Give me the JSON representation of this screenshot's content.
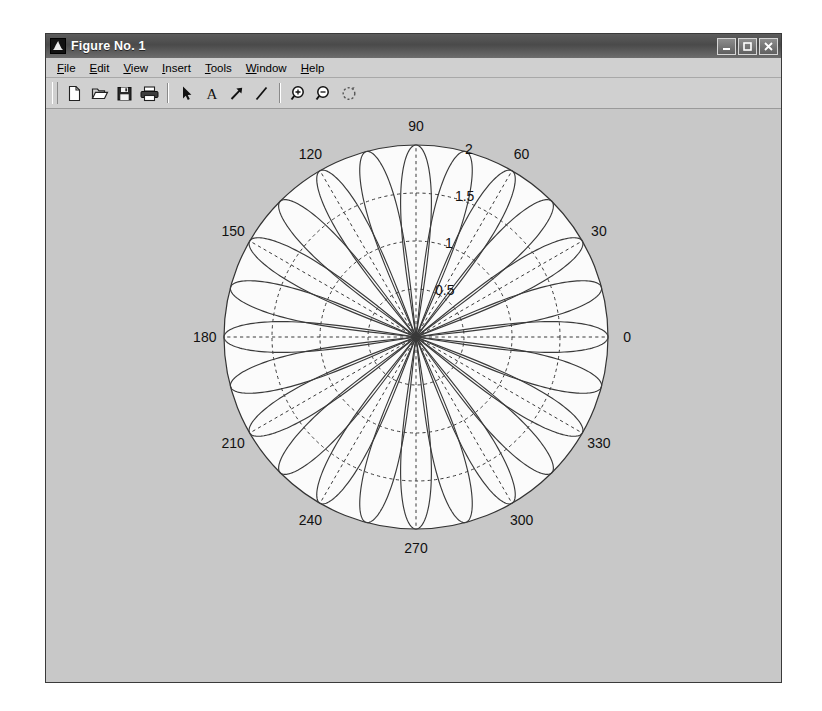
{
  "window": {
    "title": "Figure No. 1",
    "icon": "matlab-membrane-icon",
    "buttons": {
      "minimize": "minimize-icon",
      "maximize": "maximize-icon",
      "close": "close-icon"
    }
  },
  "menubar": {
    "items": [
      {
        "label": "File",
        "mnemonic": "F"
      },
      {
        "label": "Edit",
        "mnemonic": "E"
      },
      {
        "label": "View",
        "mnemonic": "V"
      },
      {
        "label": "Insert",
        "mnemonic": "I"
      },
      {
        "label": "Tools",
        "mnemonic": "T"
      },
      {
        "label": "Window",
        "mnemonic": "W"
      },
      {
        "label": "Help",
        "mnemonic": "H"
      }
    ]
  },
  "toolbar": {
    "groups": [
      [
        "new-figure-icon",
        "open-file-icon",
        "save-figure-icon",
        "print-figure-icon"
      ],
      [
        "pointer-arrow-icon",
        "insert-text-icon",
        "insert-arrow-icon",
        "insert-line-icon"
      ],
      [
        "zoom-in-icon",
        "zoom-out-icon",
        "rotate-3d-icon"
      ]
    ],
    "tooltips": {
      "new-figure-icon": "New Figure",
      "open-file-icon": "Open File",
      "save-figure-icon": "Save Figure",
      "print-figure-icon": "Print Figure",
      "pointer-arrow-icon": "Edit Plot",
      "insert-text-icon": "Insert Text",
      "insert-arrow-icon": "Insert Arrow",
      "insert-line-icon": "Insert Line",
      "zoom-in-icon": "Zoom In",
      "zoom-out-icon": "Zoom Out",
      "rotate-3d-icon": "Rotate 3D"
    }
  },
  "colors": {
    "figure_background": "#c8c8c8",
    "axes_background": "#fbfbfb",
    "line_color": "#3a3a3a",
    "grid_color": "#3a3a3a",
    "title_bar": "#4a4a4a"
  },
  "chart_data": {
    "type": "line",
    "projection": "polar",
    "title": "",
    "xlabel": "",
    "ylabel": "",
    "angle_unit": "degrees",
    "theta_ticks": [
      0,
      30,
      60,
      90,
      120,
      150,
      180,
      210,
      240,
      270,
      300,
      330
    ],
    "theta_tick_labels": [
      "0",
      "30",
      "60",
      "90",
      "120",
      "150",
      "180",
      "210",
      "240",
      "270",
      "300",
      "330"
    ],
    "r_ticks": [
      0.5,
      1,
      1.5,
      2
    ],
    "r_tick_labels": [
      "0.5",
      "1",
      "1.5",
      "2"
    ],
    "rlim": [
      0,
      2
    ],
    "r_label_angle": 78,
    "grid": true,
    "grid_style": "dashed",
    "legend": null,
    "series": [
      {
        "name": "petal-000",
        "lobe_center_deg": 0,
        "peak_r": 2,
        "half_width_deg": 9
      },
      {
        "name": "petal-015",
        "lobe_center_deg": 15,
        "peak_r": 2,
        "half_width_deg": 9
      },
      {
        "name": "petal-030",
        "lobe_center_deg": 30,
        "peak_r": 2,
        "half_width_deg": 9
      },
      {
        "name": "petal-045",
        "lobe_center_deg": 45,
        "peak_r": 2,
        "half_width_deg": 9
      },
      {
        "name": "petal-060",
        "lobe_center_deg": 60,
        "peak_r": 2,
        "half_width_deg": 9
      },
      {
        "name": "petal-075",
        "lobe_center_deg": 75,
        "peak_r": 2,
        "half_width_deg": 9
      },
      {
        "name": "petal-090",
        "lobe_center_deg": 90,
        "peak_r": 2,
        "half_width_deg": 9
      },
      {
        "name": "petal-105",
        "lobe_center_deg": 105,
        "peak_r": 2,
        "half_width_deg": 9
      },
      {
        "name": "petal-120",
        "lobe_center_deg": 120,
        "peak_r": 2,
        "half_width_deg": 9
      },
      {
        "name": "petal-135",
        "lobe_center_deg": 135,
        "peak_r": 2,
        "half_width_deg": 9
      },
      {
        "name": "petal-150",
        "lobe_center_deg": 150,
        "peak_r": 2,
        "half_width_deg": 9
      },
      {
        "name": "petal-165",
        "lobe_center_deg": 165,
        "peak_r": 2,
        "half_width_deg": 9
      }
    ]
  }
}
